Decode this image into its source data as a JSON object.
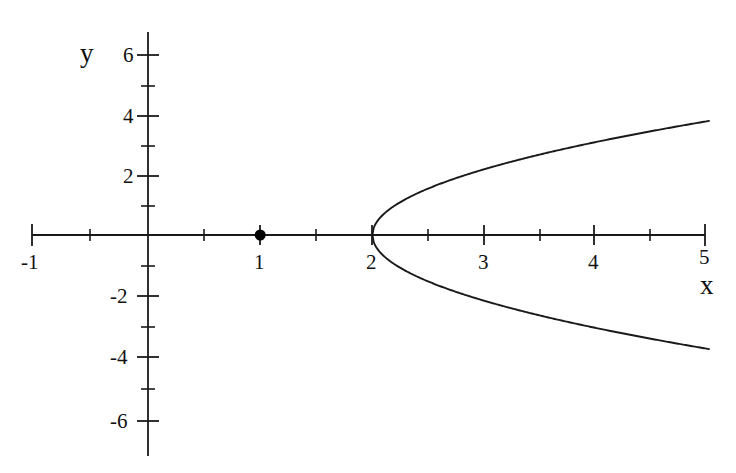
{
  "chart_data": {
    "type": "line",
    "title": "",
    "xlabel": "x",
    "ylabel": "y",
    "xlim": [
      -1,
      5
    ],
    "ylim": [
      -7,
      7
    ],
    "grid": false,
    "legend": "none",
    "axis_style": "cartesian-crosshair",
    "x_major_ticks": [
      -1,
      0,
      1,
      2,
      3,
      4,
      5
    ],
    "x_minor_ticks": [
      -0.5,
      0.5,
      1.5,
      2.5,
      3.5,
      4.5
    ],
    "x_tick_labels": [
      "-1",
      "",
      "1",
      "2",
      "3",
      "4",
      "5"
    ],
    "y_major_ticks": [
      -6,
      -4,
      -2,
      0,
      2,
      4,
      6
    ],
    "y_minor_ticks": [
      -5,
      -3,
      -1,
      1,
      3,
      5
    ],
    "y_tick_labels": [
      "-6",
      "-4",
      "-2",
      "",
      "2",
      "4",
      "6"
    ],
    "series": [
      {
        "name": "parabola-upper-branch",
        "equation": "y = sqrt(4.8 * (x - 2))",
        "color": "#1a1a1a",
        "points": [
          {
            "x": 2.0,
            "y": 0.0
          },
          {
            "x": 2.25,
            "y": 1.1
          },
          {
            "x": 2.5,
            "y": 1.55
          },
          {
            "x": 3.0,
            "y": 2.19
          },
          {
            "x": 3.5,
            "y": 2.68
          },
          {
            "x": 4.0,
            "y": 3.1
          },
          {
            "x": 4.5,
            "y": 3.46
          },
          {
            "x": 5.0,
            "y": 3.79
          }
        ]
      },
      {
        "name": "parabola-lower-branch",
        "equation": "y = -sqrt(4.8 * (x - 2))",
        "color": "#1a1a1a",
        "points": [
          {
            "x": 2.0,
            "y": 0.0
          },
          {
            "x": 2.25,
            "y": -1.1
          },
          {
            "x": 2.5,
            "y": -1.55
          },
          {
            "x": 3.0,
            "y": -2.19
          },
          {
            "x": 3.5,
            "y": -2.68
          },
          {
            "x": 4.0,
            "y": -3.1
          },
          {
            "x": 4.5,
            "y": -3.46
          },
          {
            "x": 5.0,
            "y": -3.79
          }
        ]
      }
    ],
    "markers": [
      {
        "name": "focus-point",
        "x": 1,
        "y": 0,
        "style": "filled-circle",
        "color": "#000000"
      }
    ],
    "vertex": {
      "x": 2,
      "y": 0
    }
  },
  "axes": {
    "y_axis_name": "y",
    "x_axis_name": "x"
  },
  "labels": {
    "y6": "6",
    "y4": "4",
    "y2": "2",
    "ym2": "-2",
    "ym4": "-4",
    "ym6": "-6",
    "xm1": "-1",
    "x1": "1",
    "x2": "2",
    "x3": "3",
    "x4": "4",
    "x5": "5"
  },
  "colors": {
    "curve": "#1a1a1a",
    "axis": "#1a1a1a",
    "background": "#ffffff",
    "text": "#111111"
  }
}
